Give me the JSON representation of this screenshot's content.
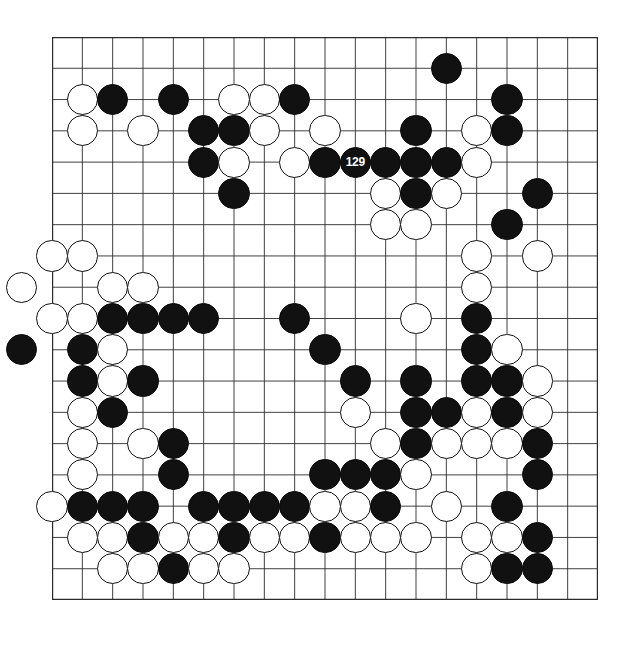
{
  "app": {
    "title": "Go Board Diagram",
    "type": "go-game-board"
  },
  "board": {
    "size": 19,
    "visible_columns": 19,
    "visible_rows": 19,
    "line_color": "#2b2b2b",
    "border_color": "#000000",
    "background_color": "#ffffff",
    "black_color": "#111111",
    "white_color": "#ffffff",
    "star_points": [
      {
        "col": 3,
        "row": 3
      },
      {
        "col": 9,
        "row": 3
      },
      {
        "col": 15,
        "row": 15
      }
    ],
    "move_label": "129",
    "last_move": {
      "col": 10,
      "row": 4,
      "color": "black",
      "label": "129"
    },
    "stones": [
      {
        "col": 13,
        "row": 1,
        "color": "black"
      },
      {
        "col": 1,
        "row": 2,
        "color": "white"
      },
      {
        "col": 2,
        "row": 2,
        "color": "black"
      },
      {
        "col": 4,
        "row": 2,
        "color": "black"
      },
      {
        "col": 6,
        "row": 2,
        "color": "white"
      },
      {
        "col": 7,
        "row": 2,
        "color": "white"
      },
      {
        "col": 8,
        "row": 2,
        "color": "black"
      },
      {
        "col": 15,
        "row": 2,
        "color": "black"
      },
      {
        "col": 1,
        "row": 3,
        "color": "white"
      },
      {
        "col": 3,
        "row": 3,
        "color": "white"
      },
      {
        "col": 5,
        "row": 3,
        "color": "black"
      },
      {
        "col": 6,
        "row": 3,
        "color": "black"
      },
      {
        "col": 7,
        "row": 3,
        "color": "white"
      },
      {
        "col": 9,
        "row": 3,
        "color": "white"
      },
      {
        "col": 12,
        "row": 3,
        "color": "black"
      },
      {
        "col": 14,
        "row": 3,
        "color": "white"
      },
      {
        "col": 15,
        "row": 3,
        "color": "black"
      },
      {
        "col": 5,
        "row": 4,
        "color": "black"
      },
      {
        "col": 6,
        "row": 4,
        "color": "white"
      },
      {
        "col": 8,
        "row": 4,
        "color": "white"
      },
      {
        "col": 9,
        "row": 4,
        "color": "black"
      },
      {
        "col": 10,
        "row": 4,
        "color": "black",
        "label": "129"
      },
      {
        "col": 11,
        "row": 4,
        "color": "black"
      },
      {
        "col": 12,
        "row": 4,
        "color": "black"
      },
      {
        "col": 13,
        "row": 4,
        "color": "black"
      },
      {
        "col": 14,
        "row": 4,
        "color": "white"
      },
      {
        "col": 6,
        "row": 5,
        "color": "black"
      },
      {
        "col": 11,
        "row": 5,
        "color": "white"
      },
      {
        "col": 12,
        "row": 5,
        "color": "black"
      },
      {
        "col": 13,
        "row": 5,
        "color": "white"
      },
      {
        "col": 16,
        "row": 5,
        "color": "black"
      },
      {
        "col": 11,
        "row": 6,
        "color": "white"
      },
      {
        "col": 12,
        "row": 6,
        "color": "white"
      },
      {
        "col": 15,
        "row": 6,
        "color": "black"
      },
      {
        "col": 0,
        "row": 7,
        "color": "white"
      },
      {
        "col": 1,
        "row": 7,
        "color": "white"
      },
      {
        "col": 14,
        "row": 7,
        "color": "white"
      },
      {
        "col": 16,
        "row": 7,
        "color": "white"
      },
      {
        "col": -1,
        "row": 8,
        "color": "white"
      },
      {
        "col": 2,
        "row": 8,
        "color": "white"
      },
      {
        "col": 3,
        "row": 8,
        "color": "white"
      },
      {
        "col": 14,
        "row": 8,
        "color": "white"
      },
      {
        "col": 0,
        "row": 9,
        "color": "white"
      },
      {
        "col": 1,
        "row": 9,
        "color": "white"
      },
      {
        "col": 2,
        "row": 9,
        "color": "black"
      },
      {
        "col": 3,
        "row": 9,
        "color": "black"
      },
      {
        "col": 4,
        "row": 9,
        "color": "black"
      },
      {
        "col": 5,
        "row": 9,
        "color": "black"
      },
      {
        "col": 8,
        "row": 9,
        "color": "black"
      },
      {
        "col": 12,
        "row": 9,
        "color": "white"
      },
      {
        "col": 14,
        "row": 9,
        "color": "black"
      },
      {
        "col": -1,
        "row": 10,
        "color": "black"
      },
      {
        "col": 1,
        "row": 10,
        "color": "black"
      },
      {
        "col": 2,
        "row": 10,
        "color": "white"
      },
      {
        "col": 9,
        "row": 10,
        "color": "black"
      },
      {
        "col": 14,
        "row": 10,
        "color": "black"
      },
      {
        "col": 15,
        "row": 10,
        "color": "white"
      },
      {
        "col": 1,
        "row": 11,
        "color": "black"
      },
      {
        "col": 2,
        "row": 11,
        "color": "white"
      },
      {
        "col": 3,
        "row": 11,
        "color": "black"
      },
      {
        "col": 10,
        "row": 11,
        "color": "black"
      },
      {
        "col": 12,
        "row": 11,
        "color": "black"
      },
      {
        "col": 14,
        "row": 11,
        "color": "black"
      },
      {
        "col": 15,
        "row": 11,
        "color": "black"
      },
      {
        "col": 16,
        "row": 11,
        "color": "white"
      },
      {
        "col": 1,
        "row": 12,
        "color": "white"
      },
      {
        "col": 2,
        "row": 12,
        "color": "black"
      },
      {
        "col": 10,
        "row": 12,
        "color": "white"
      },
      {
        "col": 12,
        "row": 12,
        "color": "black"
      },
      {
        "col": 13,
        "row": 12,
        "color": "black"
      },
      {
        "col": 14,
        "row": 12,
        "color": "white"
      },
      {
        "col": 15,
        "row": 12,
        "color": "black"
      },
      {
        "col": 16,
        "row": 12,
        "color": "white"
      },
      {
        "col": 1,
        "row": 13,
        "color": "white"
      },
      {
        "col": 3,
        "row": 13,
        "color": "white"
      },
      {
        "col": 4,
        "row": 13,
        "color": "black"
      },
      {
        "col": 11,
        "row": 13,
        "color": "white"
      },
      {
        "col": 12,
        "row": 13,
        "color": "black"
      },
      {
        "col": 13,
        "row": 13,
        "color": "white"
      },
      {
        "col": 14,
        "row": 13,
        "color": "white"
      },
      {
        "col": 15,
        "row": 13,
        "color": "white"
      },
      {
        "col": 16,
        "row": 13,
        "color": "black"
      },
      {
        "col": 1,
        "row": 14,
        "color": "white"
      },
      {
        "col": 4,
        "row": 14,
        "color": "black"
      },
      {
        "col": 9,
        "row": 14,
        "color": "black"
      },
      {
        "col": 10,
        "row": 14,
        "color": "black"
      },
      {
        "col": 11,
        "row": 14,
        "color": "black"
      },
      {
        "col": 12,
        "row": 14,
        "color": "white"
      },
      {
        "col": 16,
        "row": 14,
        "color": "black"
      },
      {
        "col": 0,
        "row": 15,
        "color": "white"
      },
      {
        "col": 1,
        "row": 15,
        "color": "black"
      },
      {
        "col": 2,
        "row": 15,
        "color": "black"
      },
      {
        "col": 3,
        "row": 15,
        "color": "black"
      },
      {
        "col": 5,
        "row": 15,
        "color": "black"
      },
      {
        "col": 6,
        "row": 15,
        "color": "black"
      },
      {
        "col": 7,
        "row": 15,
        "color": "black"
      },
      {
        "col": 8,
        "row": 15,
        "color": "black"
      },
      {
        "col": 9,
        "row": 15,
        "color": "white"
      },
      {
        "col": 10,
        "row": 15,
        "color": "white"
      },
      {
        "col": 11,
        "row": 15,
        "color": "black"
      },
      {
        "col": 13,
        "row": 15,
        "color": "white"
      },
      {
        "col": 15,
        "row": 15,
        "color": "black"
      },
      {
        "col": 1,
        "row": 16,
        "color": "white"
      },
      {
        "col": 2,
        "row": 16,
        "color": "white"
      },
      {
        "col": 3,
        "row": 16,
        "color": "black"
      },
      {
        "col": 4,
        "row": 16,
        "color": "white"
      },
      {
        "col": 5,
        "row": 16,
        "color": "white"
      },
      {
        "col": 6,
        "row": 16,
        "color": "black"
      },
      {
        "col": 7,
        "row": 16,
        "color": "white"
      },
      {
        "col": 8,
        "row": 16,
        "color": "white"
      },
      {
        "col": 9,
        "row": 16,
        "color": "black"
      },
      {
        "col": 10,
        "row": 16,
        "color": "white"
      },
      {
        "col": 11,
        "row": 16,
        "color": "white"
      },
      {
        "col": 12,
        "row": 16,
        "color": "white"
      },
      {
        "col": 14,
        "row": 16,
        "color": "white"
      },
      {
        "col": 15,
        "row": 16,
        "color": "white"
      },
      {
        "col": 16,
        "row": 16,
        "color": "black"
      },
      {
        "col": 2,
        "row": 17,
        "color": "white"
      },
      {
        "col": 3,
        "row": 17,
        "color": "white"
      },
      {
        "col": 4,
        "row": 17,
        "color": "black"
      },
      {
        "col": 5,
        "row": 17,
        "color": "white"
      },
      {
        "col": 6,
        "row": 17,
        "color": "white"
      },
      {
        "col": 14,
        "row": 17,
        "color": "white"
      },
      {
        "col": 15,
        "row": 17,
        "color": "black"
      },
      {
        "col": 16,
        "row": 17,
        "color": "black"
      }
    ]
  }
}
